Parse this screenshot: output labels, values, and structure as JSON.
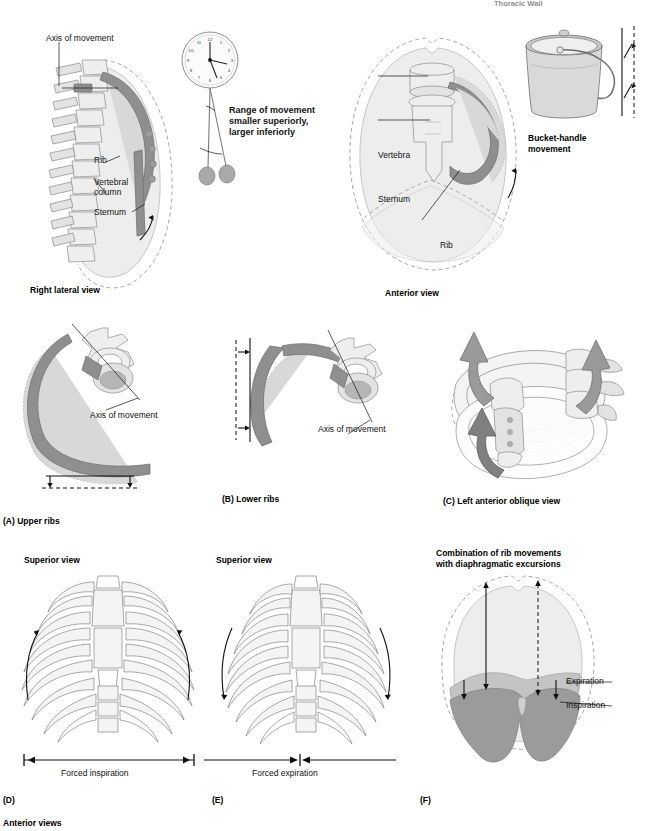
{
  "header": {
    "title": "Thoracic Wall",
    "page_number": ""
  },
  "figure": {
    "panel_top_left": {
      "caption": "Right lateral view",
      "labels": {
        "axis": "Axis of movement",
        "rib": "Rib",
        "vertebral_column": "Vertebral\ncolumn",
        "sternum": "Sternum"
      }
    },
    "pendulum": {
      "note_line1": "Range of movement",
      "note_line2": "smaller superiorly,",
      "note_line3": "larger inferiorly",
      "clock_numerals": [
        "12",
        "1",
        "2",
        "3",
        "4",
        "5",
        "6",
        "7",
        "8",
        "9",
        "10",
        "11"
      ]
    },
    "panel_top_middle": {
      "caption": "Anterior view",
      "labels": {
        "vertebra": "Vertebra",
        "sternum": "Sternum",
        "rib": "Rib"
      }
    },
    "panel_top_right": {
      "caption_line1": "Bucket-handle",
      "caption_line2": "movement"
    },
    "panel_a": {
      "letter": "(A)",
      "title": "Upper ribs",
      "label_axis": "Axis of movement"
    },
    "panel_b": {
      "letter": "(B)",
      "title": "Lower ribs",
      "label_axis": "Axis of movement"
    },
    "panel_c": {
      "letter": "(C)",
      "title": "Left anterior oblique view"
    },
    "panel_d": {
      "letter": "(D)",
      "view": "Superior view",
      "measure_label": "Forced inspiration"
    },
    "panel_e": {
      "letter": "(E)",
      "view": "Superior view",
      "measure_label": "Forced expiration"
    },
    "panel_f": {
      "letter": "(F)",
      "title_line1": "Combination of rib movements",
      "title_line2": "with diaphragmatic excursions",
      "label_expiration": "Expiration",
      "label_inspiration": "Inspiration"
    },
    "footer_caption": "Anterior views"
  },
  "colors": {
    "rib_dark": "#8f8f8f",
    "rib_ghost": "#d8d8d8",
    "lung_fill": "#ededed",
    "diaphragm_inspiration": "#9b9b9b",
    "diaphragm_expiration": "#c4c4c4",
    "ink": "#111111"
  }
}
